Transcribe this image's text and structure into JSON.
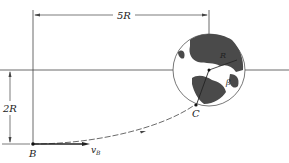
{
  "diagram": {
    "labels": {
      "horizontal_dimension": "5R",
      "vertical_dimension": "2R",
      "point_b": "B",
      "velocity": "v",
      "velocity_sub": "B",
      "point_c": "C",
      "radius": "R",
      "angle": "β"
    },
    "colors": {
      "line": "#333333",
      "earth_land": "#4a4a4a",
      "earth_outline": "#555555"
    }
  }
}
